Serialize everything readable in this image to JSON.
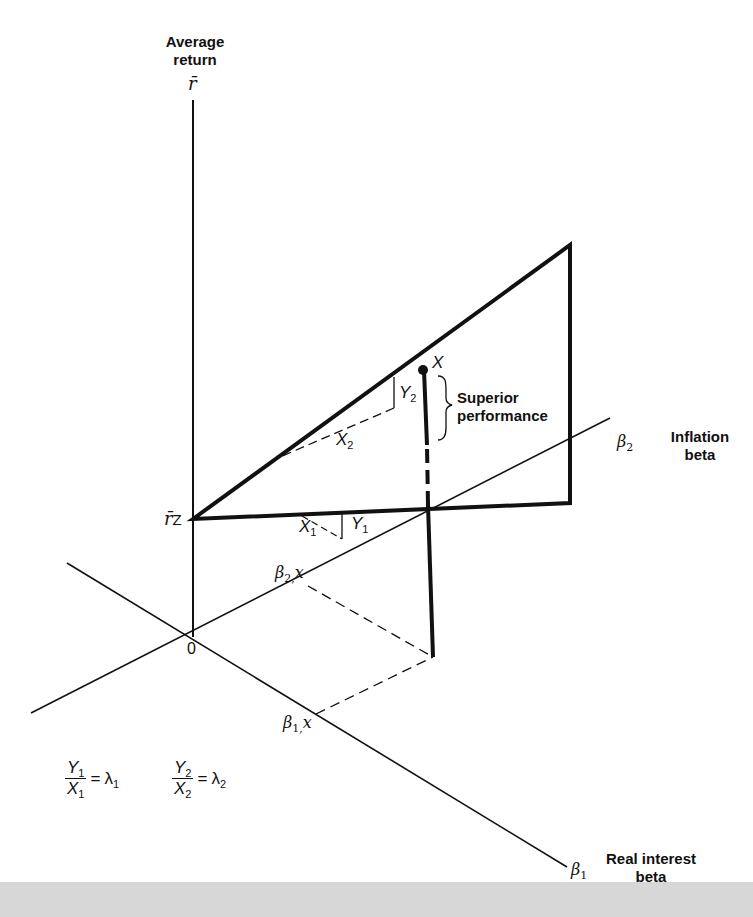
{
  "figure": {
    "axes": {
      "vertical": {
        "title_line1": "Average",
        "title_line2": "return",
        "symbol": "r̄"
      },
      "inflation": {
        "symbol": "β",
        "subscript": "2",
        "title_line1": "Inflation",
        "title_line2": "beta"
      },
      "real_interest": {
        "symbol": "β",
        "subscript": "1",
        "title_line1": "Real interest",
        "title_line2": "beta"
      },
      "origin": "0"
    },
    "intercept": {
      "symbol": "r̄",
      "subscript": "Z"
    },
    "point": {
      "label": "X"
    },
    "projections": {
      "beta2x": {
        "symbol": "β",
        "subscript": "2,",
        "suffix": "x"
      },
      "beta1x": {
        "symbol": "β",
        "subscript": "1,",
        "suffix": "x"
      }
    },
    "slopes": {
      "x1": {
        "letter": "X",
        "subscript": "1"
      },
      "y1": {
        "letter": "Y",
        "subscript": "1"
      },
      "x2": {
        "letter": "X",
        "subscript": "2"
      },
      "y2": {
        "letter": "Y",
        "subscript": "2"
      }
    },
    "annotation": {
      "line1": "Superior",
      "line2": "performance"
    },
    "equations": [
      {
        "num": "Y",
        "num_sub": "1",
        "den": "X",
        "den_sub": "1",
        "rhs": "λ",
        "rhs_sub": "1"
      },
      {
        "num": "Y",
        "num_sub": "2",
        "den": "X",
        "den_sub": "2",
        "rhs": "λ",
        "rhs_sub": "2"
      }
    ],
    "colors": {
      "ink": "#111111",
      "background": "#ffffff",
      "footer_band": "#d7d7d7"
    }
  }
}
